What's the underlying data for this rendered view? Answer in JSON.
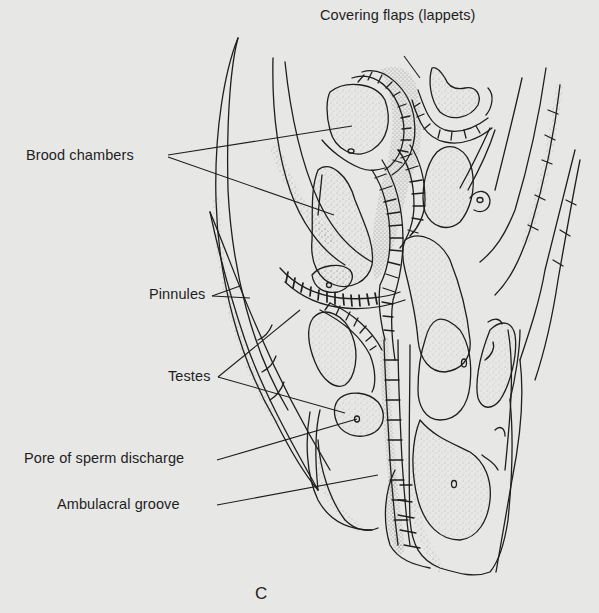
{
  "figure": {
    "panel_letter": "C",
    "background_color": "#e7e7e6",
    "ink_color": "#1e1e1e"
  },
  "labels": [
    {
      "id": "covering-flaps",
      "text": "Covering flaps (lappets)",
      "x": 320,
      "y": 7
    },
    {
      "id": "brood-chambers",
      "text": "Brood chambers",
      "x": 26,
      "y": 148
    },
    {
      "id": "pinnules",
      "text": "Pinnules",
      "x": 149,
      "y": 287
    },
    {
      "id": "testes",
      "text": "Testes",
      "x": 168,
      "y": 370
    },
    {
      "id": "pore-of-sperm-discharge",
      "text": "Pore of sperm discharge",
      "x": 24,
      "y": 450
    },
    {
      "id": "ambulacral-groove",
      "text": "Ambulacral groove",
      "x": 57,
      "y": 495
    }
  ]
}
